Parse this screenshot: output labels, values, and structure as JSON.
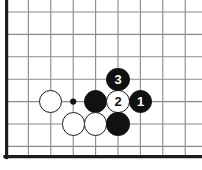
{
  "diagram": {
    "type": "go-board-problem-diagram",
    "board": {
      "background_color": "#ffffff",
      "grid_line_color": "#8a8a8a",
      "edge_line_color": "#1c1c1c",
      "grid_spacing_px": 22.4,
      "origin_x_px": 6,
      "origin_y_px": 12,
      "columns": 9,
      "rows": 7,
      "edges": [
        "left",
        "bottom"
      ],
      "star_points": [
        {
          "col": 3,
          "row": 4,
          "label": "hoshi"
        }
      ]
    },
    "stones": [
      {
        "id": "stone-white-a",
        "color": "white",
        "col": 2,
        "row": 4,
        "label": ""
      },
      {
        "id": "stone-black-b",
        "color": "black",
        "col": 4,
        "row": 4,
        "label": ""
      },
      {
        "id": "stone-white-move-2",
        "color": "white",
        "col": 5,
        "row": 4,
        "label": "2"
      },
      {
        "id": "stone-black-move-1",
        "color": "black",
        "col": 6,
        "row": 4,
        "label": "1"
      },
      {
        "id": "stone-black-move-3",
        "color": "black",
        "col": 5,
        "row": 3,
        "label": "3"
      },
      {
        "id": "stone-white-c",
        "color": "white",
        "col": 3,
        "row": 5,
        "label": ""
      },
      {
        "id": "stone-white-d",
        "color": "white",
        "col": 4,
        "row": 5,
        "label": ""
      },
      {
        "id": "stone-black-e",
        "color": "black",
        "col": 5,
        "row": 5,
        "label": ""
      }
    ],
    "move_sequence": [
      {
        "number": "1",
        "color": "black"
      },
      {
        "number": "2",
        "color": "white"
      },
      {
        "number": "3",
        "color": "black"
      }
    ]
  }
}
